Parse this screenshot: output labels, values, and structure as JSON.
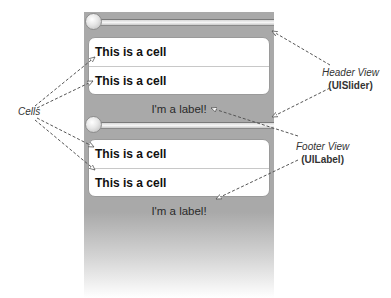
{
  "table": {
    "sections": [
      {
        "header": {
          "type": "slider"
        },
        "cells": [
          {
            "label": "This is a cell"
          },
          {
            "label": "This is a cell"
          }
        ],
        "footer": {
          "label": "I'm a label!"
        }
      },
      {
        "header": {
          "type": "slider"
        },
        "cells": [
          {
            "label": "This is a cell"
          },
          {
            "label": "This is a cell"
          }
        ],
        "footer": {
          "label": "I'm a label!"
        }
      }
    ]
  },
  "annotations": {
    "cells": {
      "title": "Cells"
    },
    "header": {
      "title": "Header View",
      "sub": "(UISlider)"
    },
    "footer": {
      "title": "Footer View",
      "sub": "(UILabel)"
    }
  },
  "colors": {
    "panel_gray": "#a9a9a9",
    "cell_bg": "#ffffff",
    "arrow": "#555555"
  }
}
